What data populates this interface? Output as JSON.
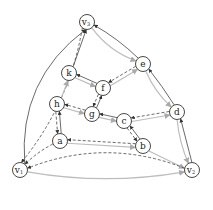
{
  "diagram": {
    "type": "directed-graph",
    "colors": {
      "solid": "#444444",
      "dashed": "#444444",
      "gray": "#bdbdbd",
      "node_stroke": "#333333"
    },
    "nodes": [
      {
        "id": "v3",
        "label": "v",
        "sub": "3",
        "x": 87,
        "y": 22
      },
      {
        "id": "k",
        "label": "k",
        "sub": "",
        "x": 69,
        "y": 73
      },
      {
        "id": "f",
        "label": "f",
        "sub": "",
        "x": 103,
        "y": 88
      },
      {
        "id": "e",
        "label": "e",
        "sub": "",
        "x": 143,
        "y": 64
      },
      {
        "id": "h",
        "label": "h",
        "sub": "",
        "x": 57,
        "y": 104
      },
      {
        "id": "g",
        "label": "g",
        "sub": "",
        "x": 92,
        "y": 114
      },
      {
        "id": "c",
        "label": "c",
        "sub": "",
        "x": 124,
        "y": 121
      },
      {
        "id": "d",
        "label": "d",
        "sub": "",
        "x": 177,
        "y": 112
      },
      {
        "id": "a",
        "label": "a",
        "sub": "",
        "x": 60,
        "y": 141
      },
      {
        "id": "b",
        "label": "b",
        "sub": "",
        "x": 143,
        "y": 146
      },
      {
        "id": "v1",
        "label": "v",
        "sub": "1",
        "x": 20,
        "y": 170
      },
      {
        "id": "v2",
        "label": "v",
        "sub": "2",
        "x": 192,
        "y": 170
      }
    ],
    "edges": [
      {
        "from": "k",
        "to": "v3",
        "style": "solid"
      },
      {
        "from": "v1",
        "to": "v3",
        "style": "solid"
      },
      {
        "from": "v3",
        "to": "v1",
        "style": "dashed"
      },
      {
        "from": "e",
        "to": "v3",
        "style": "solid"
      },
      {
        "from": "v3",
        "to": "e",
        "style": "gray"
      },
      {
        "from": "f",
        "to": "k",
        "style": "solid"
      },
      {
        "from": "k",
        "to": "f",
        "style": "gray"
      },
      {
        "from": "e",
        "to": "f",
        "style": "dashed"
      },
      {
        "from": "f",
        "to": "e",
        "style": "gray"
      },
      {
        "from": "h",
        "to": "k",
        "style": "gray"
      },
      {
        "from": "g",
        "to": "f",
        "style": "solid"
      },
      {
        "from": "f",
        "to": "g",
        "style": "dashed"
      },
      {
        "from": "g",
        "to": "h",
        "style": "dashed"
      },
      {
        "from": "h",
        "to": "g",
        "style": "gray"
      },
      {
        "from": "c",
        "to": "g",
        "style": "solid"
      },
      {
        "from": "g",
        "to": "c",
        "style": "gray"
      },
      {
        "from": "a",
        "to": "h",
        "style": "solid"
      },
      {
        "from": "h",
        "to": "a",
        "style": "dashed"
      },
      {
        "from": "d",
        "to": "e",
        "style": "solid"
      },
      {
        "from": "e",
        "to": "d",
        "style": "gray"
      },
      {
        "from": "d",
        "to": "c",
        "style": "dashed"
      },
      {
        "from": "c",
        "to": "d",
        "style": "gray"
      },
      {
        "from": "b",
        "to": "c",
        "style": "solid"
      },
      {
        "from": "c",
        "to": "b",
        "style": "dashed"
      },
      {
        "from": "b",
        "to": "a",
        "style": "dashed"
      },
      {
        "from": "a",
        "to": "b",
        "style": "gray"
      },
      {
        "from": "a",
        "to": "v1",
        "style": "dashed"
      },
      {
        "from": "v2",
        "to": "d",
        "style": "solid"
      },
      {
        "from": "d",
        "to": "v2",
        "style": "gray"
      },
      {
        "from": "b",
        "to": "v2",
        "style": "gray"
      },
      {
        "from": "v1",
        "to": "v2",
        "style": "gray"
      },
      {
        "from": "v2",
        "to": "v1",
        "style": "dashed"
      }
    ]
  }
}
